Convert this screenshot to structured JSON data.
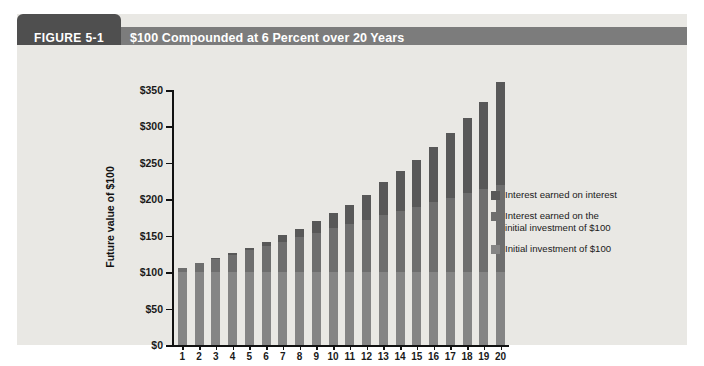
{
  "figure": {
    "number": "FIGURE 5-1",
    "title": "$100 Compounded at 6 Percent over 20 Years"
  },
  "colors": {
    "header_bar": "#7c7c7c",
    "header_tab": "#4f4f4f",
    "panel_bg": "#e9e8e4",
    "interest_on_interest": "#585858",
    "interest_on_initial": "#6e6e6e",
    "initial_investment": "#858585"
  },
  "legend": {
    "items": [
      {
        "label": "Interest earned on interest",
        "color": "#585858"
      },
      {
        "label": "Interest earned on the\ninitial investment of $100",
        "color": "#6e6e6e"
      },
      {
        "label": "Initial investment of $100",
        "color": "#858585"
      }
    ]
  },
  "chart_data": {
    "type": "bar",
    "stacked": true,
    "title": "$100 Compounded at 6 Percent over 20 Years",
    "xlabel": "Number of years",
    "ylabel": "Future value of $100",
    "ylim": [
      0,
      350
    ],
    "yticks": [
      0,
      50,
      100,
      150,
      200,
      250,
      300,
      350
    ],
    "ytick_labels": [
      "$0",
      "$50",
      "$100",
      "$150",
      "$200",
      "$250",
      "$300",
      "$350"
    ],
    "grid": false,
    "legend_position": "right",
    "categories": [
      "1",
      "2",
      "3",
      "4",
      "5",
      "6",
      "7",
      "8",
      "9",
      "10",
      "11",
      "12",
      "13",
      "14",
      "15",
      "16",
      "17",
      "18",
      "19",
      "20"
    ],
    "series": [
      {
        "name": "Initial investment of $100",
        "color": "#858585",
        "values": [
          100,
          100,
          100,
          100,
          100,
          100,
          100,
          100,
          100,
          100,
          100,
          100,
          100,
          100,
          100,
          100,
          100,
          100,
          100,
          100
        ]
      },
      {
        "name": "Interest earned on the initial investment of $100",
        "color": "#6e6e6e",
        "values": [
          6,
          12,
          18,
          24,
          30,
          36,
          42,
          48,
          54,
          60,
          66,
          72,
          78,
          84,
          90,
          96,
          102,
          108,
          114,
          120
        ]
      },
      {
        "name": "Interest earned on interest",
        "color": "#585858",
        "values": [
          0,
          0.4,
          1.1,
          2.2,
          3.8,
          5.9,
          8.5,
          11.8,
          15.9,
          20.9,
          26.8,
          33.7,
          45.8,
          54.4,
          64.4,
          75.7,
          88.6,
          103.2,
          119.6,
          140.7
        ]
      }
    ],
    "totals": [
      106,
      112,
      119,
      126,
      134,
      142,
      150,
      159,
      169,
      179,
      190,
      201,
      213,
      226,
      240,
      254,
      269,
      285,
      302,
      321
    ]
  }
}
